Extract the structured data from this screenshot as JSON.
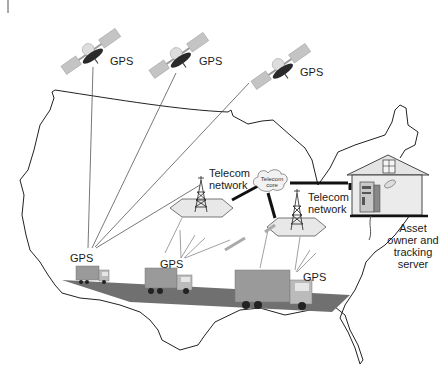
{
  "diagram": {
    "type": "gps-fleet-tracking",
    "satellites": [
      {
        "label": "GPS",
        "icon": "satellite-icon"
      },
      {
        "label": "GPS",
        "icon": "satellite-icon"
      },
      {
        "label": "GPS",
        "icon": "satellite-icon"
      }
    ],
    "telecom_networks": [
      {
        "line1": "Telecom",
        "line2": "network",
        "icon": "cell-tower-icon"
      },
      {
        "line1": "Telecom",
        "line2": "network",
        "icon": "cell-tower-icon"
      }
    ],
    "telecom_core": {
      "line1": "Telecom",
      "line2": "core",
      "icon": "cloud-icon"
    },
    "trucks": [
      {
        "gps_label": "GPS",
        "icon": "truck-icon"
      },
      {
        "gps_label": "GPS",
        "icon": "truck-icon"
      },
      {
        "gps_label": "GPS",
        "icon": "truck-icon"
      }
    ],
    "server": {
      "lines": [
        "Asset",
        "owner and",
        "tracking",
        "server"
      ],
      "icon": "server-icon",
      "building_icon": "house-icon"
    },
    "map": {
      "region": "United States (contiguous)",
      "icon": "us-map-outline"
    },
    "colors": {
      "line": "#333333",
      "road": "#6e6e6e",
      "hexagon_fill": "#e8e8e8",
      "house_fill": "#e4e4e4",
      "solar_panel": "#bdbdbd",
      "dish": "#2a2a2a"
    }
  }
}
